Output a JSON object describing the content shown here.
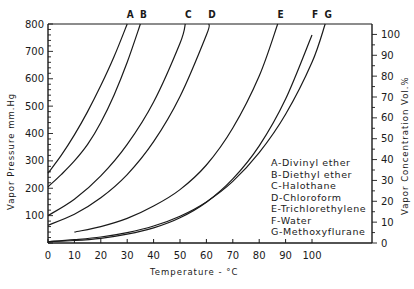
{
  "chart_data": {
    "type": "line",
    "title": "",
    "xlabel": "Temperature - °C",
    "ylabel": "Vapor Pressure mm.Hg",
    "y2label": "Vapor Concentration Vol.%",
    "xlim": [
      0,
      120
    ],
    "ylim": [
      0,
      800
    ],
    "y2lim": [
      0,
      105
    ],
    "grid": false,
    "legend_position": "inside-lower-right",
    "x_ticks": [
      0,
      10,
      20,
      30,
      40,
      50,
      60,
      70,
      80,
      90,
      100
    ],
    "y_ticks": [
      100,
      200,
      300,
      400,
      500,
      600,
      700,
      800
    ],
    "y2_ticks": [
      0,
      10,
      20,
      30,
      40,
      50,
      60,
      70,
      80,
      90,
      100
    ],
    "series": [
      {
        "key": "A",
        "name": "Divinyl ether",
        "x": [
          0,
          5,
          10,
          15,
          20,
          25,
          30
        ],
        "y": [
          255,
          320,
          395,
          480,
          575,
          680,
          800
        ]
      },
      {
        "key": "B",
        "name": "Diethyl ether",
        "x": [
          0,
          5,
          10,
          15,
          20,
          25,
          30,
          35
        ],
        "y": [
          205,
          250,
          300,
          360,
          440,
          540,
          660,
          800
        ]
      },
      {
        "key": "C",
        "name": "Halothane",
        "x": [
          0,
          10,
          20,
          30,
          40,
          50,
          52
        ],
        "y": [
          100,
          160,
          245,
          360,
          515,
          730,
          800
        ]
      },
      {
        "key": "D",
        "name": "Chloroform",
        "x": [
          0,
          10,
          20,
          30,
          40,
          50,
          60,
          61
        ],
        "y": [
          65,
          105,
          165,
          250,
          370,
          535,
          760,
          800
        ]
      },
      {
        "key": "E",
        "name": "Trichlorethylene",
        "x": [
          10,
          20,
          30,
          40,
          50,
          60,
          70,
          80,
          87
        ],
        "y": [
          40,
          60,
          90,
          135,
          195,
          285,
          420,
          610,
          800
        ]
      },
      {
        "key": "F",
        "name": "Water",
        "x": [
          0,
          10,
          20,
          30,
          40,
          50,
          60,
          70,
          80,
          90,
          100
        ],
        "y": [
          5,
          9,
          17,
          32,
          55,
          92,
          149,
          234,
          355,
          526,
          760
        ]
      },
      {
        "key": "G",
        "name": "Methoxyflurane",
        "x": [
          0,
          10,
          20,
          30,
          40,
          50,
          60,
          70,
          80,
          90,
          100,
          105
        ],
        "y": [
          5,
          12,
          22,
          38,
          62,
          98,
          150,
          225,
          330,
          470,
          660,
          800
        ]
      }
    ]
  },
  "labels": {
    "curve_keys": [
      "A",
      "B",
      "C",
      "D",
      "E",
      "F",
      "G"
    ],
    "legend": [
      "A-Divinyl ether",
      "B-Diethyl ether",
      "C-Halothane",
      "D-Chloroform",
      "E-Trichlorethylene",
      "F-Water",
      "G-Methoxyflurane"
    ],
    "xlabel": "Temperature - °C",
    "ylabel": "Vapor Pressure mm.Hg",
    "y2label": "Vapor Concentration Vol.%"
  }
}
